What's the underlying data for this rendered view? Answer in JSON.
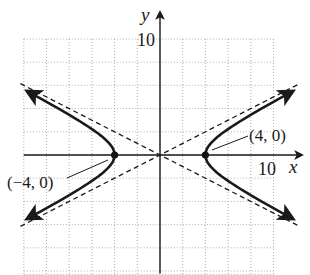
{
  "chart_data": {
    "type": "line",
    "title": "",
    "xlabel": "x",
    "ylabel": "y",
    "xlim": [
      -12,
      10
    ],
    "ylim": [
      -10.3,
      10
    ],
    "grid": true,
    "grid_step": 2,
    "grid_style": "dotted",
    "tick_labels": {
      "x": [
        {
          "value": 10,
          "label": "10"
        }
      ],
      "y": [
        {
          "value": 10,
          "label": "10"
        }
      ]
    },
    "series": [
      {
        "name": "hyperbola",
        "equation": "x^2/16 - y^2/4 = 1",
        "style": "solid",
        "branches": [
          "left",
          "right"
        ],
        "x_range_abs": [
          4,
          11.7
        ]
      },
      {
        "name": "asymptote-positive",
        "equation": "y = x/2",
        "style": "dashed"
      },
      {
        "name": "asymptote-negative",
        "equation": "y = -x/2",
        "style": "dashed"
      }
    ],
    "points": [
      {
        "x": -4,
        "y": 0,
        "label": "(−4, 0)"
      },
      {
        "x": 4,
        "y": 0,
        "label": "(4, 0)"
      }
    ],
    "annotations": [
      "(−4, 0)",
      "(4, 0)"
    ]
  },
  "labels": {
    "x_axis": "x",
    "y_axis": "y",
    "x_tick_10": "10",
    "y_tick_10": "10",
    "vertex_left": "(−4, 0)",
    "vertex_right": "(4, 0)"
  },
  "colors": {
    "curve": "#1a1a1a",
    "grid": "#9a9a9a",
    "axis": "#1a1a1a"
  }
}
